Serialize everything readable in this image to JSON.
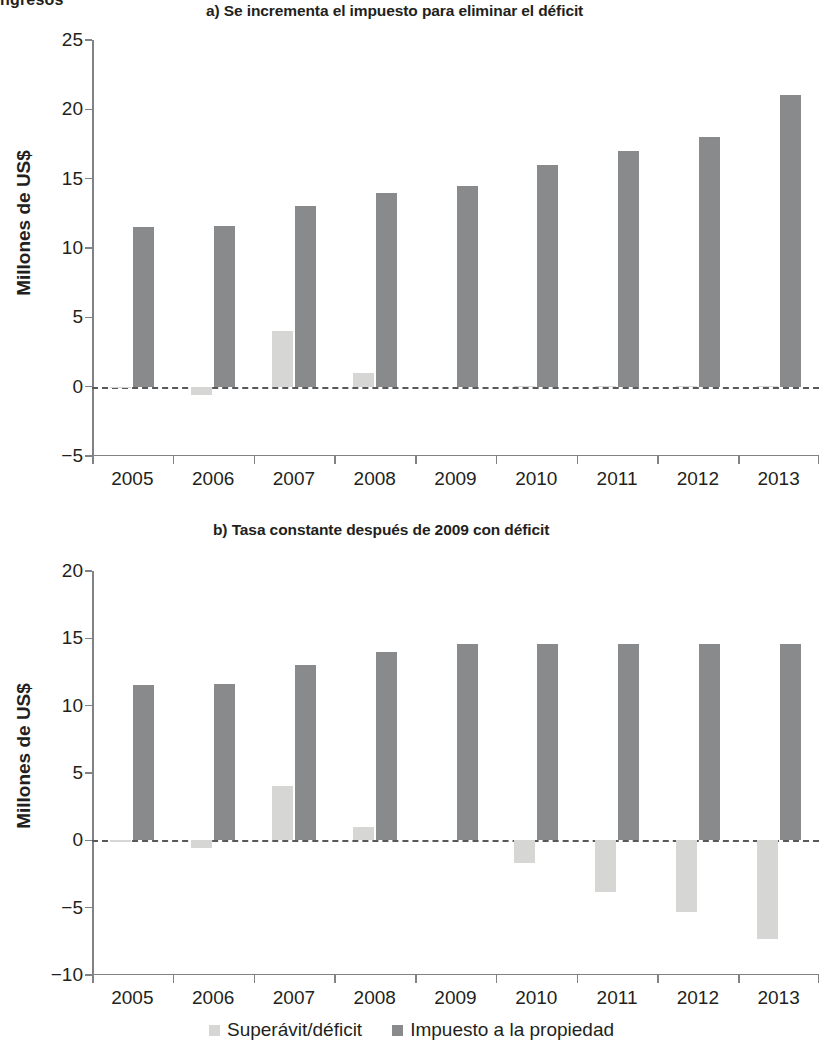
{
  "document": {
    "cutoff_heading": "ngresos"
  },
  "legend": {
    "items": [
      {
        "label": "Superávit/déficit",
        "color": "#d6d6d4",
        "key": "surplus"
      },
      {
        "label": "Impuesto a la propiedad",
        "color": "#898a8c",
        "key": "tax"
      }
    ]
  },
  "panel_a": {
    "title": "a) Se incrementa el impuesto para eliminar el déficit",
    "ylabel": "Millones de US$"
  },
  "panel_b": {
    "title": "b) Tasa constante después de 2009 con déficit",
    "ylabel": "Millones de US$"
  },
  "chart_data": [
    {
      "id": "a",
      "type": "bar",
      "title": "a) Se incrementa el impuesto para eliminar el déficit",
      "xlabel": "",
      "ylabel": "Millones de US$",
      "categories": [
        "2005",
        "2006",
        "2007",
        "2008",
        "2009",
        "2010",
        "2011",
        "2012",
        "2013"
      ],
      "series": [
        {
          "name": "Superávit/déficit",
          "color": "#d6d6d4",
          "values": [
            -0.1,
            -0.6,
            4.0,
            1.0,
            0.0,
            0.05,
            0.05,
            0.05,
            0.05
          ]
        },
        {
          "name": "Impuesto a la propiedad",
          "color": "#898a8c",
          "values": [
            11.5,
            11.6,
            13.0,
            14.0,
            14.5,
            16.0,
            17.0,
            18.0,
            21.0
          ]
        }
      ],
      "ylim": [
        -5,
        25
      ],
      "yticks": [
        -5,
        0,
        5,
        10,
        15,
        20,
        25
      ],
      "ytick_labels": [
        "−5",
        "0",
        "5",
        "10",
        "15",
        "20",
        "25"
      ],
      "grid": false,
      "zero_line": true,
      "legend_position": "bottom"
    },
    {
      "id": "b",
      "type": "bar",
      "title": "b) Tasa constante después de 2009 con déficit",
      "xlabel": "",
      "ylabel": "Millones de US$",
      "categories": [
        "2005",
        "2006",
        "2007",
        "2008",
        "2009",
        "2010",
        "2011",
        "2012",
        "2013"
      ],
      "series": [
        {
          "name": "Superávit/déficit",
          "color": "#d6d6d4",
          "values": [
            -0.1,
            -0.6,
            4.0,
            1.0,
            0.0,
            -1.7,
            -3.8,
            -5.3,
            -7.3
          ]
        },
        {
          "name": "Impuesto a la propiedad",
          "color": "#898a8c",
          "values": [
            11.5,
            11.6,
            13.0,
            14.0,
            14.6,
            14.6,
            14.6,
            14.6,
            14.6
          ]
        }
      ],
      "ylim": [
        -10,
        20
      ],
      "yticks": [
        -10,
        -5,
        0,
        5,
        10,
        15,
        20
      ],
      "ytick_labels": [
        "−10",
        "−5",
        "0",
        "5",
        "10",
        "15",
        "20"
      ],
      "grid": false,
      "zero_line": true,
      "legend_position": "bottom"
    }
  ]
}
